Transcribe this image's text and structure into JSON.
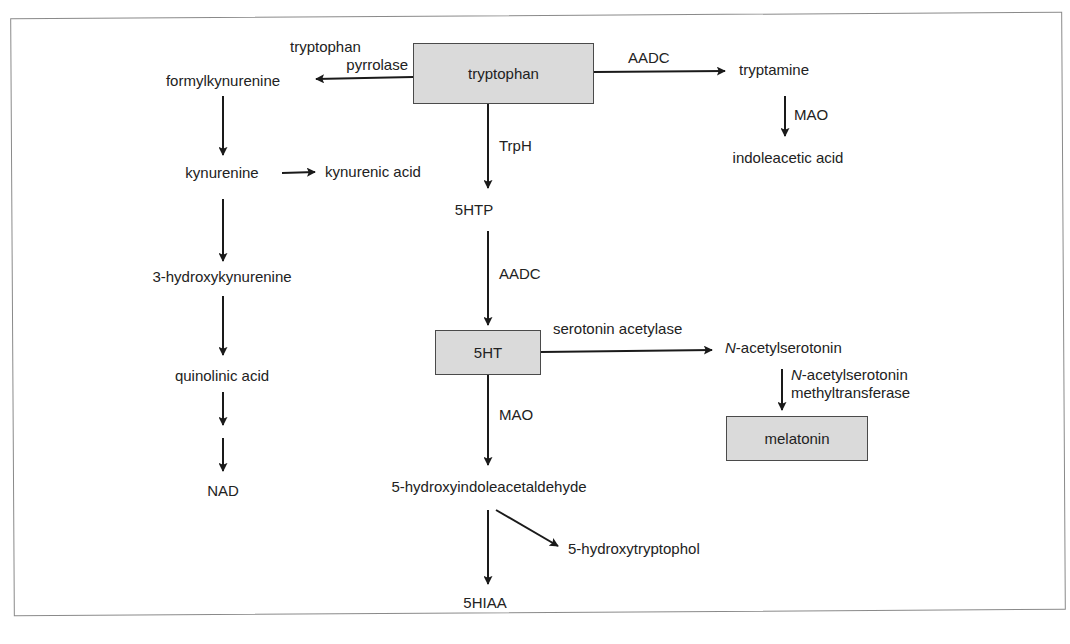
{
  "diagram": {
    "type": "metabolic-pathway",
    "nodes": {
      "tryptophan": "tryptophan",
      "formylkynurenine": "formylkynurenine",
      "kynurenine": "kynurenine",
      "kynurenic_acid": "kynurenic acid",
      "hydroxykynurenine": "3-hydroxykynurenine",
      "quinolinic_acid": "quinolinic acid",
      "nad": "NAD",
      "tryptamine": "tryptamine",
      "indoleacetic_acid": "indoleacetic acid",
      "htp": "5HTP",
      "ht": "5HT",
      "n_prefix": "N",
      "acetylserotonin_suffix": "-acetylserotonin",
      "melatonin": "melatonin",
      "hydroxyindoleacetaldehyde": "5-hydroxyindoleacetaldehyde",
      "hydroxytryptophol": "5-hydroxytryptophol",
      "hiaa": "5HIAA"
    },
    "enzymes": {
      "tryptophan_pyrrolase_line1": "tryptophan",
      "tryptophan_pyrrolase_line2": "pyrrolase",
      "aadc_top": "AADC",
      "mao_tryptamine": "MAO",
      "trph": "TrpH",
      "aadc_5htp": "AADC",
      "serotonin_acetylase": "serotonin acetylase",
      "nat_line1_prefix": "N",
      "nat_line1_suffix": "-acetylserotonin",
      "nat_line2": "methyltransferase",
      "mao_5ht": "MAO"
    },
    "highlighted_nodes": [
      "tryptophan",
      "5HT",
      "melatonin"
    ],
    "colors": {
      "box_fill": "#dadada",
      "box_border": "#4a4a4a",
      "line": "#1a1a1a",
      "frame": "#8a8a8a"
    },
    "edges": [
      {
        "from": "tryptophan",
        "to": "formylkynurenine",
        "enzyme": "tryptophan pyrrolase"
      },
      {
        "from": "formylkynurenine",
        "to": "kynurenine"
      },
      {
        "from": "kynurenine",
        "to": "kynurenic acid"
      },
      {
        "from": "kynurenine",
        "to": "3-hydroxykynurenine"
      },
      {
        "from": "3-hydroxykynurenine",
        "to": "quinolinic acid"
      },
      {
        "from": "quinolinic acid",
        "to": "NAD",
        "steps": 2
      },
      {
        "from": "tryptophan",
        "to": "tryptamine",
        "enzyme": "AADC"
      },
      {
        "from": "tryptamine",
        "to": "indoleacetic acid",
        "enzyme": "MAO"
      },
      {
        "from": "tryptophan",
        "to": "5HTP",
        "enzyme": "TrpH"
      },
      {
        "from": "5HTP",
        "to": "5HT",
        "enzyme": "AADC"
      },
      {
        "from": "5HT",
        "to": "N-acetylserotonin",
        "enzyme": "serotonin acetylase"
      },
      {
        "from": "N-acetylserotonin",
        "to": "melatonin",
        "enzyme": "N-acetylserotonin methyltransferase"
      },
      {
        "from": "5HT",
        "to": "5-hydroxyindoleacetaldehyde",
        "enzyme": "MAO"
      },
      {
        "from": "5-hydroxyindoleacetaldehyde",
        "to": "5HIAA"
      },
      {
        "from": "5-hydroxyindoleacetaldehyde",
        "to": "5-hydroxytryptophol"
      }
    ]
  }
}
